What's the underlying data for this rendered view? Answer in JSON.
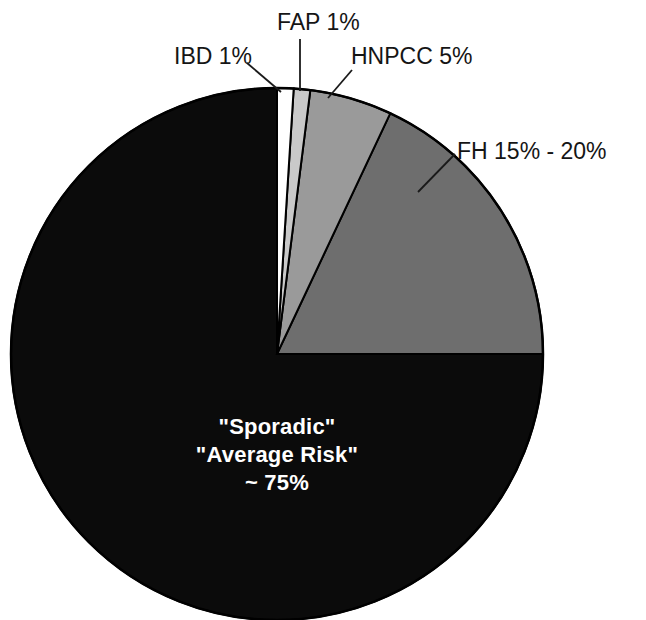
{
  "chart_data": {
    "type": "pie",
    "title": "",
    "subtitle": "",
    "xlabel": "",
    "ylabel": "",
    "legend_position": "callout-labels",
    "grid": false,
    "start_angle_deg": 0,
    "direction": "clockwise",
    "categories": [
      "IBD",
      "FAP",
      "HNPCC",
      "FH",
      "Sporadic / Average Risk"
    ],
    "values": [
      1,
      1,
      5,
      18,
      75
    ],
    "value_labels": [
      "1%",
      "1%",
      "5%",
      "15% - 20%",
      "~ 75%"
    ],
    "colors": [
      "#ffffff",
      "#c9c9c9",
      "#9a9a9a",
      "#6e6e6e",
      "#0b0b0b"
    ],
    "slices": [
      {
        "name": "IBD",
        "label": "IBD 1%",
        "value": 1,
        "value_label": "1%",
        "color": "#ffffff",
        "start_deg": 0,
        "end_deg": 3.6
      },
      {
        "name": "FAP",
        "label": "FAP 1%",
        "value": 1,
        "value_label": "1%",
        "color": "#c9c9c9",
        "start_deg": 3.6,
        "end_deg": 7.2
      },
      {
        "name": "HNPCC",
        "label": "HNPCC 5%",
        "value": 5,
        "value_label": "5%",
        "color": "#9a9a9a",
        "start_deg": 7.2,
        "end_deg": 25.2
      },
      {
        "name": "FH",
        "label": "FH 15% - 20%",
        "value": 18,
        "value_label": "15% - 20%",
        "color": "#6e6e6e",
        "start_deg": 25.2,
        "end_deg": 90
      },
      {
        "name": "Sporadic / Average Risk",
        "label": "\"Sporadic\" \"Average Risk\" ~ 75%",
        "value": 75,
        "value_label": "~ 75%",
        "color": "#0b0b0b",
        "start_deg": 90,
        "end_deg": 360
      }
    ]
  },
  "callouts": {
    "ibd": "IBD 1%",
    "fap": "FAP 1%",
    "hnpcc": "HNPCC 5%",
    "fh": "FH 15% - 20%"
  },
  "center_label": {
    "line1": "\"Sporadic\"",
    "line2": "\"Average Risk\"",
    "line3": "~ 75%"
  },
  "style": {
    "outline_color": "#000000",
    "leader_color": "#1a1a1a",
    "background": "#ffffff",
    "text_color": "#151515",
    "center_text_color": "#ffffff"
  }
}
